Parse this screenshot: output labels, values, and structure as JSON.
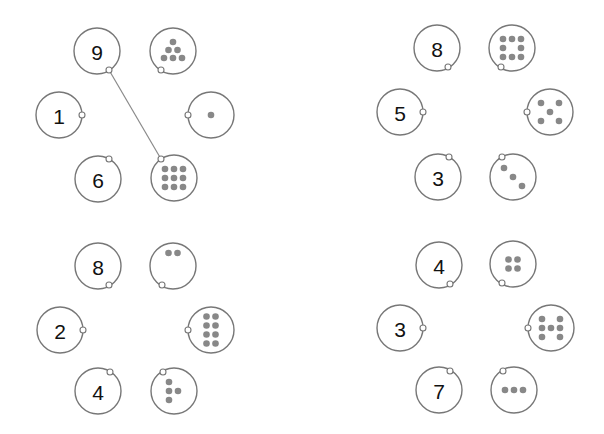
{
  "puzzle": {
    "description": "Match number circles to dot-count circles",
    "colors": {
      "ring": "#777777",
      "dot": "#888888",
      "link": "#8a8a8a",
      "text": "#111111"
    },
    "panels": [
      {
        "id": "top-left",
        "numbers": [
          {
            "value": "9",
            "cx": 97,
            "cy": 51,
            "port": [
              109,
              70
            ]
          },
          {
            "value": "1",
            "cx": 59,
            "cy": 115,
            "port": [
              82,
              115
            ]
          },
          {
            "value": "6",
            "cx": 98,
            "cy": 179,
            "port": [
              109,
              159
            ]
          }
        ],
        "dots": [
          {
            "count": 6,
            "cx": 173,
            "cy": 51,
            "port": [
              161,
              70
            ],
            "pts": [
              [
                0,
                -9
              ],
              [
                -4.5,
                -1
              ],
              [
                4.5,
                -1
              ],
              [
                -9,
                7
              ],
              [
                0,
                7
              ],
              [
                9,
                7
              ]
            ]
          },
          {
            "count": 1,
            "cx": 211,
            "cy": 115,
            "port": [
              188,
              115
            ],
            "pts": [
              [
                0,
                0
              ]
            ]
          },
          {
            "count": 9,
            "cx": 174,
            "cy": 178,
            "port": [
              161,
              159
            ],
            "pts": [
              [
                -9,
                -9
              ],
              [
                0,
                -9
              ],
              [
                9,
                -9
              ],
              [
                -9,
                0
              ],
              [
                0,
                0
              ],
              [
                9,
                0
              ],
              [
                -9,
                9
              ],
              [
                0,
                9
              ],
              [
                9,
                9
              ]
            ]
          }
        ],
        "links": [
          {
            "from": "9",
            "to_count": 9,
            "x1": 109,
            "y1": 70,
            "x2": 161,
            "y2": 159
          }
        ]
      },
      {
        "id": "top-right",
        "numbers": [
          {
            "value": "8",
            "cx": 437,
            "cy": 48,
            "port": [
              448,
              67
            ]
          },
          {
            "value": "5",
            "cx": 400,
            "cy": 112,
            "port": [
              423,
              112
            ]
          },
          {
            "value": "3",
            "cx": 438,
            "cy": 177,
            "port": [
              449,
              157
            ]
          }
        ],
        "dots": [
          {
            "count": 8,
            "cx": 512,
            "cy": 48,
            "port": [
              501,
              67
            ],
            "pts": [
              [
                -9,
                -9
              ],
              [
                0,
                -9
              ],
              [
                9,
                -9
              ],
              [
                -9,
                0
              ],
              [
                9,
                0
              ],
              [
                -9,
                9
              ],
              [
                0,
                9
              ],
              [
                9,
                9
              ]
            ]
          },
          {
            "count": 5,
            "cx": 550,
            "cy": 112,
            "port": [
              527,
              112
            ],
            "pts": [
              [
                -9,
                -9
              ],
              [
                9,
                -9
              ],
              [
                0,
                0
              ],
              [
                -9,
                9
              ],
              [
                9,
                9
              ]
            ]
          },
          {
            "count": 3,
            "cx": 513,
            "cy": 177,
            "port": [
              502,
              157
            ],
            "pts": [
              [
                -9,
                -9
              ],
              [
                0,
                0
              ],
              [
                9,
                9
              ]
            ]
          }
        ],
        "links": []
      },
      {
        "id": "bottom-left",
        "numbers": [
          {
            "value": "8",
            "cx": 98,
            "cy": 266,
            "port": [
              109,
              285
            ]
          },
          {
            "value": "2",
            "cx": 60,
            "cy": 330,
            "port": [
              83,
              330
            ]
          },
          {
            "value": "4",
            "cx": 98,
            "cy": 391,
            "port": [
              110,
              372
            ]
          }
        ],
        "dots": [
          {
            "count": 2,
            "cx": 173,
            "cy": 266,
            "port": [
              162,
              285
            ],
            "pts": [
              [
                -4.5,
                -13
              ],
              [
                4.5,
                -13
              ]
            ]
          },
          {
            "count": 8,
            "cx": 211,
            "cy": 330,
            "port": [
              188,
              330
            ],
            "pts": [
              [
                -4.5,
                -13.5
              ],
              [
                4.5,
                -13.5
              ],
              [
                -4.5,
                -4.5
              ],
              [
                4.5,
                -4.5
              ],
              [
                -4.5,
                4.5
              ],
              [
                4.5,
                4.5
              ],
              [
                -4.5,
                13.5
              ],
              [
                4.5,
                13.5
              ]
            ]
          },
          {
            "count": 4,
            "cx": 174,
            "cy": 391,
            "port": [
              163,
              372
            ],
            "pts": [
              [
                -5,
                -9
              ],
              [
                -5,
                0
              ],
              [
                4,
                0
              ],
              [
                -5,
                9
              ]
            ]
          }
        ],
        "links": []
      },
      {
        "id": "bottom-right",
        "numbers": [
          {
            "value": "4",
            "cx": 439,
            "cy": 265,
            "port": [
              450,
              284
            ]
          },
          {
            "value": "3",
            "cx": 400,
            "cy": 328,
            "port": [
              423,
              328
            ]
          },
          {
            "value": "7",
            "cx": 439,
            "cy": 390,
            "port": [
              450,
              371
            ]
          }
        ],
        "dots": [
          {
            "count": 4,
            "cx": 513,
            "cy": 264,
            "port": [
              502,
              283
            ],
            "pts": [
              [
                -4.5,
                -4.5
              ],
              [
                4.5,
                -4.5
              ],
              [
                -4.5,
                4.5
              ],
              [
                4.5,
                4.5
              ]
            ]
          },
          {
            "count": 7,
            "cx": 551,
            "cy": 328,
            "port": [
              528,
              328
            ],
            "pts": [
              [
                -9,
                -9
              ],
              [
                9,
                -9
              ],
              [
                -9,
                0
              ],
              [
                0,
                0
              ],
              [
                9,
                0
              ],
              [
                -9,
                9
              ],
              [
                9,
                9
              ]
            ]
          },
          {
            "count": 3,
            "cx": 514,
            "cy": 390,
            "port": [
              503,
              371
            ],
            "pts": [
              [
                -9,
                0
              ],
              [
                0,
                0
              ],
              [
                9,
                0
              ]
            ]
          }
        ],
        "links": []
      }
    ]
  }
}
